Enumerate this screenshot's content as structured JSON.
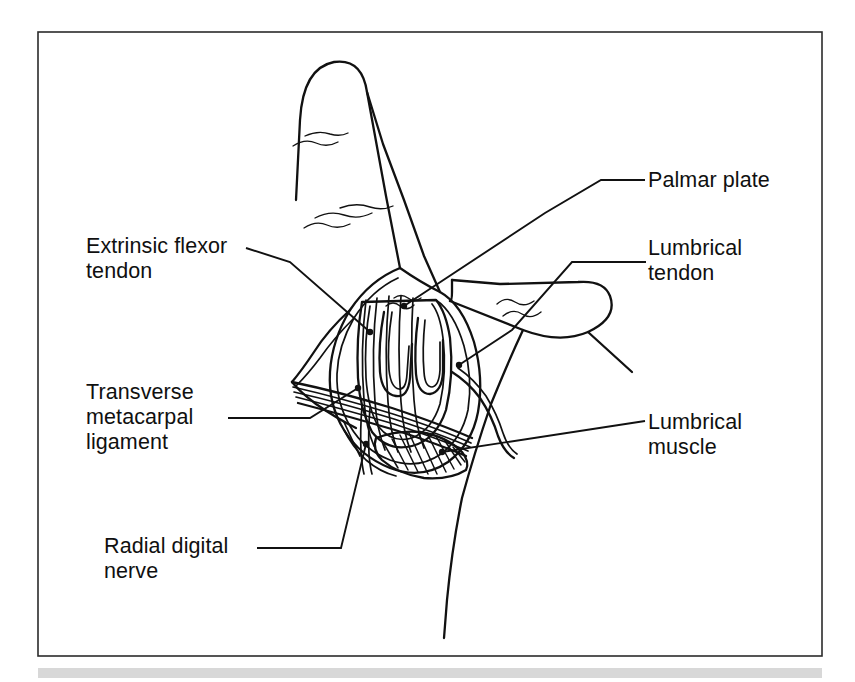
{
  "figure": {
    "kind": "anatomical-line-drawing",
    "frame_color": "#2b2b2b",
    "ink_color": "#111111",
    "background_color": "#ffffff",
    "footer_strip_color": "#d8d8d8"
  },
  "labels": {
    "palmar_plate": {
      "text": "Palmar plate",
      "side": "right",
      "lines": 1
    },
    "lumbrical_tendon": {
      "text": "Lumbrical\ntendon",
      "side": "right",
      "lines": 2
    },
    "lumbrical_muscle": {
      "text": "Lumbrical\nmuscle",
      "side": "right",
      "lines": 2
    },
    "extrinsic_flexor_tendon": {
      "text": "Extrinsic flexor\ntendon",
      "side": "left",
      "lines": 2
    },
    "transverse_metacarpal_ligament": {
      "text": "Transverse\nmetacarpal\nligament",
      "side": "left",
      "lines": 3
    },
    "radial_digital_nerve": {
      "text": "Radial digital\nnerve",
      "side": "left",
      "lines": 2
    }
  },
  "structures": [
    {
      "name": "index-finger",
      "description": "index finger extended upward with two flexion creases"
    },
    {
      "name": "middle-finger",
      "description": "middle finger angled down to the right with one flexion crease"
    },
    {
      "name": "palm-contour",
      "description": "palm outline descending to lower right"
    },
    {
      "name": "dissection-window",
      "description": "oval opened window over the metacarpophalangeal joint"
    },
    {
      "name": "flexor-tendon-sheath",
      "description": "longitudinal fibers of the extrinsic flexor tendon"
    },
    {
      "name": "palmar-plate",
      "description": "U-shaped plate deep in the window"
    },
    {
      "name": "transverse-metacarpal-ligament",
      "description": "multi-stranded band sweeping across the window"
    },
    {
      "name": "lumbrical-muscle",
      "description": "hatched muscle belly at lower right of window"
    },
    {
      "name": "lumbrical-tendon",
      "description": "tendon passing out to the radial side"
    },
    {
      "name": "radial-digital-nerve",
      "description": "nerve descending below the ligament"
    }
  ]
}
